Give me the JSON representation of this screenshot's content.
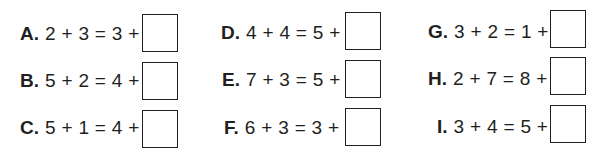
{
  "worksheet": {
    "problems": [
      {
        "label": "A.",
        "expression": "2 + 3 = 3 +",
        "answer": ""
      },
      {
        "label": "B.",
        "expression": "5 + 2 = 4 +",
        "answer": ""
      },
      {
        "label": "C.",
        "expression": "5 + 1 = 4 +",
        "answer": ""
      },
      {
        "label": "D.",
        "expression": "4 + 4 = 5 +",
        "answer": ""
      },
      {
        "label": "E.",
        "expression": "7 + 3 = 5 +",
        "answer": ""
      },
      {
        "label": "F.",
        "expression": "6 + 3 = 3 +",
        "answer": ""
      },
      {
        "label": "G.",
        "expression": "3 + 2 = 1 +",
        "answer": ""
      },
      {
        "label": "H.",
        "expression": "2 + 7 = 8 +",
        "answer": ""
      },
      {
        "label": "I.",
        "expression": "3 + 4 = 5 +",
        "answer": ""
      }
    ]
  }
}
